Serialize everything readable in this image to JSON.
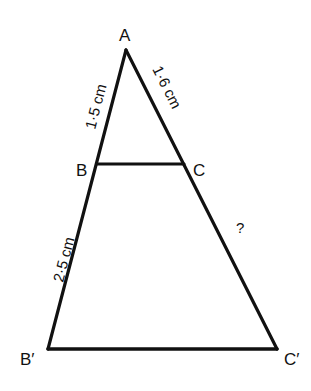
{
  "diagram": {
    "type": "similar-triangles",
    "colors": {
      "stroke": "#111111",
      "background": "#ffffff"
    },
    "vertices": {
      "A": {
        "label": "A",
        "x": 126,
        "y": 50
      },
      "B": {
        "label": "B",
        "x": 97,
        "y": 164
      },
      "C": {
        "label": "C",
        "x": 184,
        "y": 164
      },
      "B2": {
        "label": "B′",
        "x": 48,
        "y": 349
      },
      "C2": {
        "label": "C′",
        "x": 277,
        "y": 349
      }
    },
    "measurements": {
      "AB": "1·5 cm",
      "AC": "1·6 cm",
      "BB2": "2·5 cm",
      "CC2": "?"
    },
    "segments": [
      "A-B2",
      "A-C2",
      "B-C",
      "B2-C2"
    ]
  }
}
